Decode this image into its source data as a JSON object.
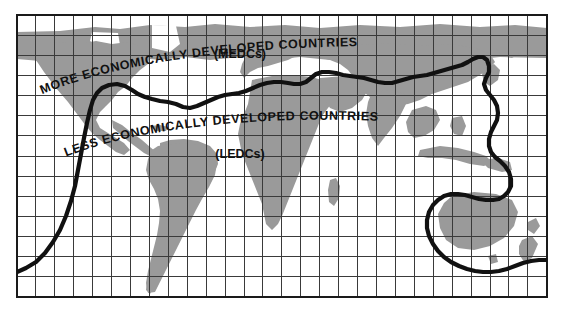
{
  "figure": {
    "kind": "world-map",
    "projection": "equirectangular-graticule",
    "labels": {
      "medcs_band": "MORE ECONOMICALLY DEVELOPED COUNTRIES",
      "medcs_abbr": "(MEDCs)",
      "ledcs_band": "LESS ECONOMICALLY DEVELOPED COUNTRIES",
      "ledcs_abbr": "(LEDCs)"
    },
    "colors": {
      "page_background": "#ffffff",
      "ocean": "#ffffff",
      "land": "#9a9a9a",
      "graticule": "#3a3a3a",
      "map_border": "#1a1a1a",
      "divide_line": "#111111",
      "label_text": "#111111"
    },
    "graticule": {
      "columns": 28,
      "rows": 14,
      "visible": true
    },
    "map_frame": {
      "left": 17,
      "top": 15,
      "right": 547,
      "bottom": 297
    },
    "divide_line": {
      "name": "Brandt Line",
      "stroke_width": 4,
      "encircles": [
        "Australia",
        "New Zealand"
      ],
      "description": "Thick line running west to east separating the wealthy north from the poorer south, dipping to include Australia and New Zealand in the north group."
    }
  }
}
